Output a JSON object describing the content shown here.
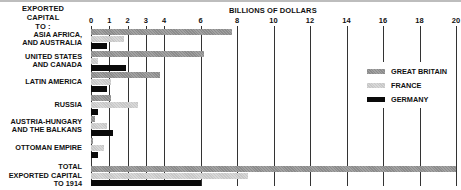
{
  "header": {
    "left_title": "EXPORTED CAPITAL TO :",
    "left_line1": "EXPORTED CAPITAL",
    "left_line2": "TO :",
    "axis_title": "BILLIONS OF DOLLARS"
  },
  "colors": {
    "great_britain": "#969696",
    "france": "#d0d0d0",
    "germany": "#0a0a0a"
  },
  "legend": [
    {
      "label": "GREAT BRITAIN",
      "key": "gb"
    },
    {
      "label": "FRANCE",
      "key": "fr"
    },
    {
      "label": "GERMANY",
      "key": "de"
    }
  ],
  "chart_data": {
    "type": "bar",
    "orientation": "horizontal",
    "xlabel": "BILLIONS OF DOLLARS",
    "ylabel": "EXPORTED CAPITAL TO :",
    "xlim": [
      0,
      20
    ],
    "xticks": [
      0,
      1,
      2,
      3,
      4,
      6,
      8,
      10,
      12,
      14,
      16,
      18,
      20
    ],
    "grid": true,
    "legend_position": "right",
    "categories": [
      "ASIA AFRICA, AND AUSTRALIA",
      "UNITED STATES AND CANADA",
      "LATIN AMERICA",
      "RUSSIA",
      "AUSTRIA-HUNGARY AND THE BALKANS",
      "OTTOMAN EMPIRE",
      "TOTAL EXPORTED CAPITAL TO 1914"
    ],
    "series": [
      {
        "name": "GREAT BRITAIN",
        "values": [
          7.7,
          6.2,
          3.8,
          1.1,
          0.2,
          0.1,
          20.0
        ]
      },
      {
        "name": "FRANCE",
        "values": [
          1.8,
          0.4,
          1.1,
          2.6,
          0.9,
          0.7,
          8.6
        ]
      },
      {
        "name": "GERMANY",
        "values": [
          0.9,
          1.9,
          0.9,
          0.4,
          1.2,
          0.4,
          6.0
        ]
      }
    ]
  },
  "category_labels": [
    [
      "ASIA  AFRICA,",
      "AND AUSTRALIA"
    ],
    [
      "UNITED STATES",
      "AND CANADA"
    ],
    [
      "LATIN AMERICA"
    ],
    [
      "RUSSIA"
    ],
    [
      "AUSTRIA-HUNGARY",
      "AND THE BALKANS"
    ],
    [
      "OTTOMAN EMPIRE"
    ],
    [
      "TOTAL",
      "EXPORTED CAPITAL",
      "TO 1914"
    ]
  ]
}
